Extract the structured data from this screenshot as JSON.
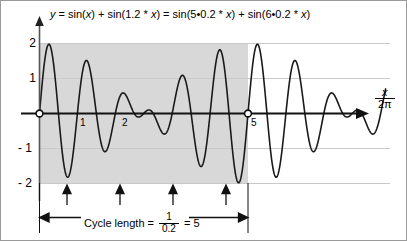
{
  "figure": {
    "title_equation": "y = sin(x) + sin(1.2 * x) = sin(5•0.2 * x) + sin(6•0.2 * x)",
    "equation_parts": {
      "y": "y",
      "eq1": " = sin(",
      "x1": "x",
      "mid": ") + sin(1.2 * ",
      "x2": "x",
      "eq2": ") = sin(5•0.2 * ",
      "x3": "x",
      "tail1": ") + sin(6•0.2 * ",
      "x4": "x",
      "tail2": ")"
    },
    "axis_name": {
      "numerator": "x",
      "denominator": "2π"
    },
    "cycle_caption": {
      "label": "Cycle length =",
      "frac_numerator": "1",
      "frac_denominator": "0.2",
      "equals": "= 5"
    }
  },
  "chart_data": {
    "type": "line",
    "title": "y = sin(x) + sin(1.2 * x) = sin(5•0.2 * x) + sin(6•0.2 * x)",
    "xlabel": "x / 2π",
    "ylabel": "",
    "xlim": [
      -0.15,
      8.3
    ],
    "ylim": [
      -2.45,
      2.45
    ],
    "grid": true,
    "gridlines_y": [
      2,
      1,
      -1,
      -2
    ],
    "legend": null,
    "yticks": [
      2,
      1,
      -1,
      -2
    ],
    "ytick_labels": [
      "2",
      "1",
      "- 1",
      "- 2"
    ],
    "xticks": [
      1,
      2,
      5
    ],
    "xtick_labels": [
      "1",
      "2",
      "5"
    ],
    "series": [
      {
        "name": "sin(2πx) + sin(1.2·2πx)",
        "formula": "sin(2*pi*x) + sin(1.2*2*pi*x)",
        "color": "#1a1a1a",
        "x_start": 0,
        "x_end": 8.3,
        "samples": 1400
      }
    ],
    "shaded_region": {
      "label": "one cycle",
      "x_start": 0,
      "x_end": 5,
      "y_start": -2,
      "y_end": 2,
      "color": "#d8d8d8"
    },
    "markers": [
      {
        "name": "origin",
        "x": 0,
        "y": 0,
        "style": "open-circle"
      },
      {
        "name": "cycle-end",
        "x": 5,
        "y": 0,
        "style": "open-circle"
      }
    ],
    "beat_minima_arrows": [
      0.6667,
      1.9333,
      3.2,
      4.4667
    ],
    "dimension_line": {
      "x_start": 0,
      "x_end": 5,
      "value": 5,
      "text": "Cycle length = 1/0.2 = 5"
    },
    "annotations": [
      {
        "text": "1",
        "x": 1,
        "y": -0.2
      },
      {
        "text": "2",
        "x": 2,
        "y": -0.2
      },
      {
        "text": "5",
        "x": 5,
        "y": -0.2
      }
    ],
    "colors": {
      "curve": "#1a1a1a",
      "axis": "#000000",
      "grid": "#c9c9c9",
      "shade": "#d8d8d8",
      "border": "#9a9a9a"
    }
  }
}
